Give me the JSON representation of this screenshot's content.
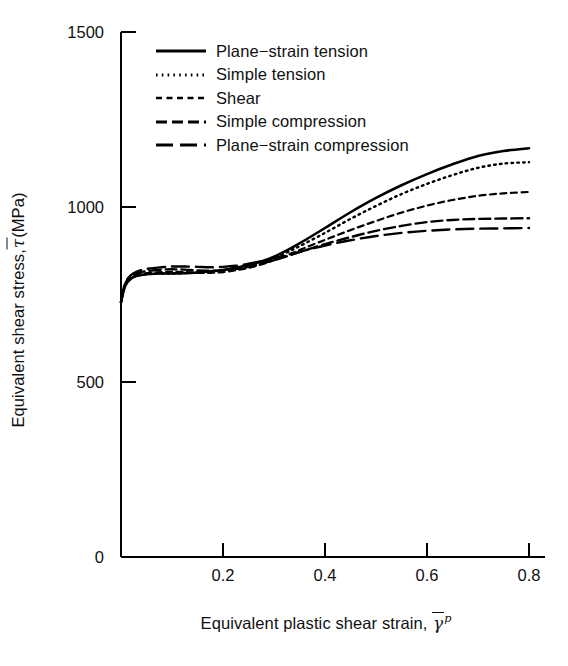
{
  "figure": {
    "background": "#ffffff",
    "line_color": "#000000"
  },
  "axes": {
    "y_title_prefix": "Equivalent shear stress, ",
    "y_title_symbol": "τ",
    "y_title_suffix": " (MPa)",
    "x_title_prefix": "Equivalent plastic shear strain, ",
    "x_title_symbol": "γ",
    "x_title_sup": "p"
  },
  "ticks": {
    "y": [
      "0",
      "500",
      "1000",
      "1500"
    ],
    "x": [
      "0.2",
      "0.4",
      "0.6",
      "0.8"
    ]
  },
  "legend": {
    "items": [
      {
        "label": "Plane−strain tension",
        "style": "solid"
      },
      {
        "label": "Simple tension",
        "style": "dotted"
      },
      {
        "label": "Shear",
        "style": "short-dash"
      },
      {
        "label": "Simple compression",
        "style": "dash"
      },
      {
        "label": "Plane−strain compression",
        "style": "long-dash"
      }
    ]
  },
  "chart_data": {
    "type": "line",
    "title": "",
    "xlabel": "Equivalent plastic shear strain, γ̄p",
    "ylabel": "Equivalent shear stress, τ̄ (MPa)",
    "xlim": [
      0,
      0.84
    ],
    "ylim": [
      0,
      1500
    ],
    "xticks": [
      0.2,
      0.4,
      0.6,
      0.8
    ],
    "yticks": [
      0,
      500,
      1000,
      1500
    ],
    "grid": false,
    "legend_position": "upper-left-inside",
    "x": [
      0,
      0.005,
      0.01,
      0.02,
      0.03,
      0.05,
      0.08,
      0.1,
      0.125,
      0.15,
      0.175,
      0.2,
      0.225,
      0.25,
      0.275,
      0.3,
      0.325,
      0.35,
      0.4,
      0.45,
      0.5,
      0.55,
      0.6,
      0.65,
      0.7,
      0.75,
      0.8
    ],
    "series": [
      {
        "name": "Plane−strain tension",
        "style": "solid",
        "values": [
          728,
          760,
          780,
          796,
          803,
          808,
          810,
          810,
          811,
          813,
          816,
          820,
          826,
          834,
          844,
          858,
          876,
          896,
          940,
          985,
          1026,
          1062,
          1094,
          1122,
          1146,
          1160,
          1168
        ]
      },
      {
        "name": "Simple tension",
        "style": "dotted",
        "values": [
          728,
          760,
          780,
          796,
          803,
          808,
          810,
          810,
          811,
          813,
          816,
          820,
          826,
          834,
          843,
          855,
          870,
          888,
          926,
          966,
          1003,
          1037,
          1066,
          1091,
          1112,
          1124,
          1128
        ]
      },
      {
        "name": "Shear",
        "style": "short-dash",
        "values": [
          728,
          762,
          782,
          798,
          805,
          811,
          814,
          815,
          814,
          812,
          812,
          814,
          819,
          826,
          836,
          848,
          862,
          877,
          906,
          934,
          960,
          984,
          1004,
          1020,
          1032,
          1039,
          1043
        ]
      },
      {
        "name": "Simple compression",
        "style": "dash",
        "values": [
          728,
          764,
          786,
          802,
          810,
          817,
          821,
          822,
          821,
          819,
          818,
          819,
          823,
          829,
          838,
          848,
          859,
          871,
          894,
          914,
          932,
          946,
          957,
          963,
          966,
          967,
          968
        ]
      },
      {
        "name": "Plane−strain compression",
        "style": "long-dash",
        "values": [
          728,
          766,
          789,
          806,
          815,
          823,
          828,
          830,
          830,
          829,
          828,
          829,
          832,
          838,
          845,
          854,
          863,
          872,
          890,
          905,
          917,
          926,
          932,
          936,
          938,
          939,
          940
        ]
      }
    ]
  }
}
